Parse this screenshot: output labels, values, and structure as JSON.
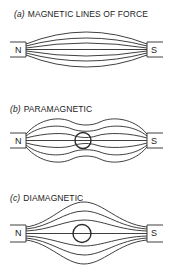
{
  "panels": [
    {
      "tag": "(a)",
      "title": "MAGNETIC LINES OF FORCE",
      "north_label": "N",
      "south_label": "S",
      "sample": "none"
    },
    {
      "tag": "(b)",
      "title": "PARAMAGNETIC",
      "north_label": "N",
      "south_label": "S",
      "sample": "circle - lines concentrate through sample"
    },
    {
      "tag": "(c)",
      "title": "DIAMAGNETIC",
      "north_label": "N",
      "south_label": "S",
      "sample": "circle - lines pushed away from sample"
    }
  ],
  "colors": {
    "line": "#2a2a2a",
    "background": "#ffffff"
  }
}
